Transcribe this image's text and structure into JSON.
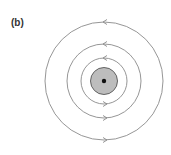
{
  "figure": {
    "panel_label": "(b)",
    "center": {
      "x": 104,
      "y": 81
    },
    "conductor": {
      "radius": 13.5,
      "fill": "#bdbdbd",
      "stroke": "#555555",
      "dot_radius": 2.2,
      "dot_color": "#111111"
    },
    "field_lines": [
      {
        "radius": 23,
        "arrow_top": "left",
        "arrow_bottom": "right"
      },
      {
        "radius": 37,
        "arrow_top": "left",
        "arrow_bottom": "right"
      },
      {
        "radius": 59,
        "arrow_top": "left",
        "arrow_bottom": "right"
      }
    ],
    "line_color": "#8a8a8a"
  }
}
